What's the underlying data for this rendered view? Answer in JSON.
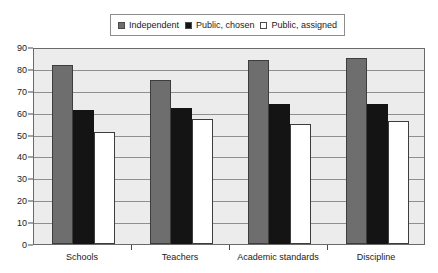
{
  "chart_data": {
    "type": "bar",
    "title": "",
    "subtitle": "",
    "xlabel": "",
    "ylabel": "",
    "categories": [
      "Schools",
      "Teachers",
      "Academic standards",
      "Discipline"
    ],
    "series": [
      {
        "name": "Independent",
        "color": "#6e6e6e",
        "values": [
          82,
          75,
          84,
          85
        ]
      },
      {
        "name": "Public, chosen",
        "color": "#141414",
        "values": [
          61,
          62,
          64,
          64
        ]
      },
      {
        "name": "Public, assigned",
        "color": "#ffffff",
        "values": [
          51,
          57,
          55,
          56
        ]
      }
    ],
    "ylim": [
      0,
      90
    ],
    "ytick_step": 10,
    "yticks": [
      0,
      10,
      20,
      30,
      40,
      50,
      60,
      70,
      80,
      90
    ],
    "ytick_labels": [
      "0",
      "10",
      "20",
      "30",
      "40",
      "50",
      "60",
      "70",
      "80",
      "90"
    ],
    "grid": true,
    "grid_axis": "y",
    "legend_position": "top-center",
    "legend_border": true,
    "plot_background": "#ececec",
    "plot_border_color": "#6a6a6a",
    "bar_border_color": "#3d3d3d"
  }
}
